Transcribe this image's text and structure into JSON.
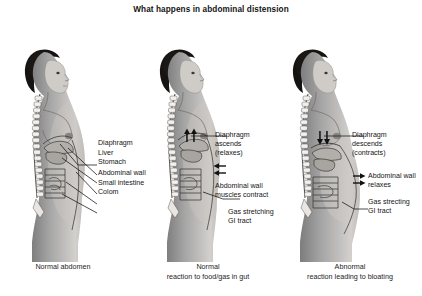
{
  "title": "What happens in abdominal distension",
  "background_color": "#ffffff",
  "text_color": "#161616",
  "panels": [
    {
      "id": "normal-abdomen",
      "caption": "Normal abdomen",
      "figure_description": "grayscale photograph of a woman in right profile with spine and internal organs sketched over the torso",
      "labels": [
        {
          "text": "Diaphragm"
        },
        {
          "text": "Liver"
        },
        {
          "text": "Stomach"
        },
        {
          "text": "Abdominal wall"
        },
        {
          "text": "Small intestine"
        },
        {
          "text": "Colom"
        }
      ],
      "arrows": []
    },
    {
      "id": "normal-reaction",
      "caption_line_1": "Normal",
      "caption_line_2": "reaction to food/gas in gut",
      "figure_description": "grayscale photograph of a woman in right profile with flat abdomen, diaphragm arrows pointing up and abdominal wall arrows pointing inward",
      "labels": [
        {
          "line_1": "Diaphragm",
          "line_2": "ascends",
          "line_3": "(relaxes)"
        },
        {
          "line_1": "Abdominal wall",
          "line_2": "muscles contract"
        },
        {
          "line_1": "Gas stretching",
          "line_2": "GI tract"
        }
      ],
      "arrows": [
        {
          "name": "diaphragm-up-arrows",
          "direction": "up",
          "count": 2
        },
        {
          "name": "abdominal-wall-inward-arrows",
          "direction": "left",
          "count": 2
        }
      ]
    },
    {
      "id": "abnormal-reaction",
      "caption_line_1": "Abnormal",
      "caption_line_2": "reaction leading to bloating",
      "figure_description": "grayscale photograph of a woman in right profile with distended protruding abdomen, diaphragm arrows pointing down and abdominal wall arrows pointing outward",
      "labels": [
        {
          "line_1": "Diaphragm",
          "line_2": "descends",
          "line_3": "(contracts)"
        },
        {
          "line_1": "Abdominal wall",
          "line_2": "relaxes"
        },
        {
          "line_1": "Gas strecting",
          "line_2": "GI tract"
        }
      ],
      "arrows": [
        {
          "name": "diaphragm-down-arrows",
          "direction": "down",
          "count": 2
        },
        {
          "name": "abdominal-wall-outward-arrows",
          "direction": "right",
          "count": 2
        }
      ]
    }
  ]
}
